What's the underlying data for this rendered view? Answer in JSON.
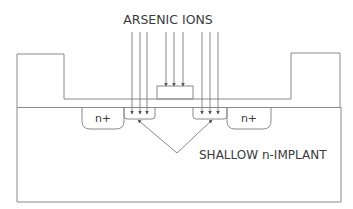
{
  "diagram": {
    "title_label": "ARSENIC IONS",
    "annotation_label": "SHALLOW n-IMPLANT",
    "regions": [
      {
        "id": "n-plus-left",
        "label": "n+"
      },
      {
        "id": "n-plus-right",
        "label": "n+"
      }
    ],
    "colors": {
      "line": "#8a8a8a",
      "text": "#3a3a3a",
      "background": "#ffffff"
    }
  }
}
